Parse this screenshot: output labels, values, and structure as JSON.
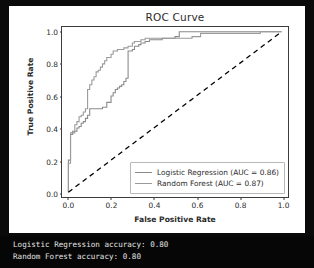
{
  "chart_data": {
    "type": "line",
    "title": "ROC Curve",
    "xlabel": "False Positive Rate",
    "ylabel": "True Positive Rate",
    "xlim": [
      -0.03,
      1.03
    ],
    "ylim": [
      -0.03,
      1.03
    ],
    "grid": false,
    "legend_position": "lower right",
    "xticks": [
      "0.0",
      "0.2",
      "0.4",
      "0.6",
      "0.8",
      "1.0"
    ],
    "xtick_values": [
      0.0,
      0.2,
      0.4,
      0.6,
      0.8,
      1.0
    ],
    "yticks": [
      "0.0",
      "0.2",
      "0.4",
      "0.6",
      "0.8",
      "1.0"
    ],
    "ytick_values": [
      0.0,
      0.2,
      0.4,
      0.6,
      0.8,
      1.0
    ],
    "series": [
      {
        "name": "Logistic Regression (AUC = 0.86)",
        "auc": 0.86,
        "color": "#8a8a8a",
        "style": "step",
        "x": [
          0.0,
          0.0,
          0.01,
          0.01,
          0.02,
          0.02,
          0.03,
          0.04,
          0.05,
          0.06,
          0.07,
          0.08,
          0.09,
          0.1,
          0.11,
          0.12,
          0.13,
          0.14,
          0.16,
          0.18,
          0.2,
          0.21,
          0.22,
          0.23,
          0.24,
          0.25,
          0.26,
          0.27,
          0.28,
          0.28,
          0.3,
          0.31,
          0.33,
          0.34,
          0.36,
          0.38,
          0.41,
          0.44,
          0.47,
          0.5,
          0.52,
          0.52,
          0.88,
          0.88,
          1.0
        ],
        "y": [
          0.0,
          0.2,
          0.2,
          0.36,
          0.36,
          0.38,
          0.38,
          0.4,
          0.41,
          0.43,
          0.44,
          0.46,
          0.48,
          0.52,
          0.52,
          0.52,
          0.52,
          0.52,
          0.53,
          0.56,
          0.6,
          0.62,
          0.64,
          0.65,
          0.66,
          0.67,
          0.69,
          0.71,
          0.78,
          0.88,
          0.89,
          0.91,
          0.92,
          0.93,
          0.94,
          0.95,
          0.95,
          0.96,
          0.96,
          0.97,
          0.97,
          1.0,
          1.0,
          1.0,
          1.0
        ]
      },
      {
        "name": "Random Forest (AUC = 0.87)",
        "auc": 0.87,
        "color": "#9a9a9a",
        "style": "step",
        "x": [
          0.0,
          0.0,
          0.01,
          0.01,
          0.02,
          0.03,
          0.03,
          0.04,
          0.05,
          0.05,
          0.06,
          0.07,
          0.08,
          0.09,
          0.09,
          0.1,
          0.11,
          0.12,
          0.13,
          0.14,
          0.15,
          0.16,
          0.17,
          0.18,
          0.2,
          0.21,
          0.23,
          0.25,
          0.26,
          0.28,
          0.3,
          0.31,
          0.33,
          0.34,
          0.35,
          0.36,
          0.38,
          0.4,
          0.42,
          0.44,
          0.47,
          0.5,
          0.58,
          0.62,
          0.7,
          0.8,
          0.88,
          0.9,
          1.0
        ],
        "y": [
          0.0,
          0.18,
          0.18,
          0.37,
          0.37,
          0.39,
          0.42,
          0.44,
          0.44,
          0.47,
          0.48,
          0.5,
          0.52,
          0.58,
          0.64,
          0.67,
          0.7,
          0.72,
          0.75,
          0.76,
          0.78,
          0.8,
          0.82,
          0.84,
          0.86,
          0.88,
          0.89,
          0.89,
          0.9,
          0.91,
          0.93,
          0.94,
          0.94,
          0.95,
          0.95,
          0.96,
          0.96,
          0.96,
          0.96,
          0.96,
          0.96,
          0.96,
          0.97,
          0.99,
          0.99,
          0.99,
          0.99,
          1.0,
          1.0
        ]
      },
      {
        "name": "chance-diagonal",
        "color": "#000000",
        "style": "dashed",
        "x": [
          0.0,
          1.0
        ],
        "y": [
          0.0,
          1.0
        ]
      }
    ]
  },
  "legend": {
    "entries": [
      {
        "label": "Logistic Regression (AUC = 0.86)",
        "color": "#8a8a8a"
      },
      {
        "label": "Random Forest (AUC = 0.87)",
        "color": "#9a9a9a"
      }
    ]
  },
  "terminal": {
    "lines": [
      "Logistic Regression accuracy: 0.80",
      "Random Forest accuracy: 0.80"
    ]
  }
}
